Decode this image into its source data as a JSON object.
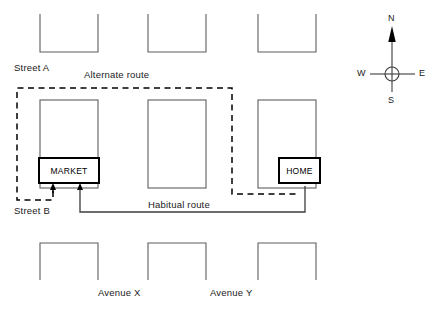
{
  "diagram": {
    "type": "schematic-street-map",
    "stroke_color": "#555555",
    "bold_stroke_color": "#000000",
    "background": "#ffffff"
  },
  "places": {
    "market": {
      "label": "MARKET",
      "x": 38,
      "y": 157,
      "w": 62,
      "h": 27
    },
    "home": {
      "label": "HOME",
      "x": 278,
      "y": 157,
      "w": 43,
      "h": 27
    }
  },
  "street_labels": [
    {
      "name": "street-a",
      "text": "Street A",
      "x": 14,
      "y": 62
    },
    {
      "name": "street-b",
      "text": "Street B",
      "x": 14,
      "y": 205
    },
    {
      "name": "avenue-x",
      "text": "Avenue X",
      "x": 98,
      "y": 287
    },
    {
      "name": "avenue-y",
      "text": "Avenue Y",
      "x": 210,
      "y": 287
    }
  ],
  "route_labels": [
    {
      "name": "alternate-route",
      "text": "Alternate route",
      "x": 84,
      "y": 70
    },
    {
      "name": "habitual-route",
      "text": "Habitual route",
      "x": 148,
      "y": 199
    }
  ],
  "compass": {
    "center_x": 392,
    "center_y": 74,
    "north": "N",
    "south": "S",
    "east": "E",
    "west": "W"
  },
  "blocks": {
    "columns_x": [
      40,
      148,
      258
    ],
    "block_width": 58,
    "top_row": {
      "y": 14,
      "height": 38,
      "open_side": "top"
    },
    "middle_row": {
      "y": 100,
      "height": 88,
      "open_side": "none"
    },
    "bottom_row": {
      "y": 243,
      "height": 37,
      "open_side": "bottom"
    }
  },
  "routes": {
    "alternate": {
      "style": "dashed",
      "description": "From market bottom, south to Street B, west, north along west edge, east along Street A, south past Avenue Y, east to home"
    },
    "habitual": {
      "style": "solid",
      "description": "From market bottom south to Street B, east along Street B, north to home"
    }
  }
}
